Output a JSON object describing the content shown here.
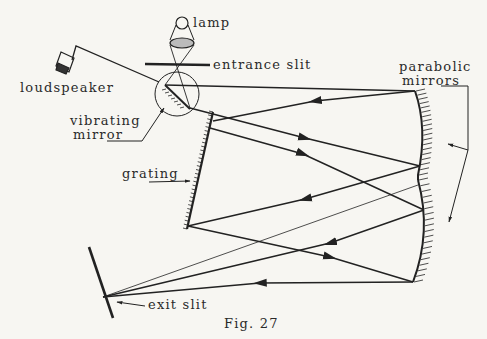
{
  "figure": {
    "caption": "Fig. 27",
    "labels": {
      "lamp": "lamp",
      "entrance_slit": "entrance slit",
      "loudspeaker": "loudspeaker",
      "vibrating_mirror_1": "vibrating",
      "vibrating_mirror_2": "mirror",
      "grating": "grating",
      "parabolic_1": "parabolic",
      "parabolic_2": "mirrors",
      "exit_slit": "exit slit"
    },
    "colors": {
      "ink": "#222222",
      "paper": "#f7f6f2"
    }
  }
}
